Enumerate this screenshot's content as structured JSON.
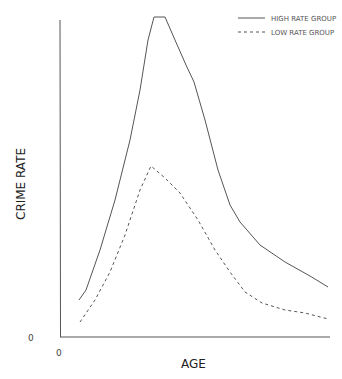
{
  "chart_data": {
    "type": "line",
    "title": "",
    "xlabel": "AGE",
    "ylabel": "CRIME RATE",
    "x_origin_label": "0",
    "y_origin_label": "0",
    "grid": false,
    "legend_position": "top-right",
    "series": [
      {
        "name": "HIGH RATE GROUP",
        "style": "solid",
        "points": [
          [
            79,
            300
          ],
          [
            86,
            290
          ],
          [
            100,
            250
          ],
          [
            115,
            200
          ],
          [
            130,
            140
          ],
          [
            140,
            90
          ],
          [
            148,
            40
          ],
          [
            154,
            17
          ],
          [
            165,
            17
          ],
          [
            175,
            40
          ],
          [
            186,
            65
          ],
          [
            194,
            82
          ],
          [
            205,
            120
          ],
          [
            218,
            170
          ],
          [
            230,
            205
          ],
          [
            240,
            222
          ],
          [
            260,
            245
          ],
          [
            285,
            262
          ],
          [
            310,
            276
          ],
          [
            328,
            287
          ]
        ]
      },
      {
        "name": "LOW RATE GROUP",
        "style": "dashed",
        "points": [
          [
            80,
            322
          ],
          [
            95,
            300
          ],
          [
            110,
            272
          ],
          [
            125,
            235
          ],
          [
            140,
            190
          ],
          [
            151,
            166
          ],
          [
            165,
            178
          ],
          [
            180,
            193
          ],
          [
            198,
            220
          ],
          [
            215,
            250
          ],
          [
            230,
            272
          ],
          [
            245,
            292
          ],
          [
            262,
            303
          ],
          [
            285,
            310
          ],
          [
            305,
            313
          ],
          [
            328,
            319
          ]
        ]
      }
    ],
    "axes": {
      "y_axis": {
        "x": 60,
        "y_top": 20,
        "y_bottom": 337
      },
      "x_axis": {
        "y": 337,
        "x_left": 60,
        "x_right": 330
      }
    }
  },
  "legend": {
    "high": "HIGH RATE GROUP",
    "low": "LOW RATE GROUP"
  },
  "labels": {
    "x_axis": "AGE",
    "y_axis": "CRIME RATE",
    "x_zero": "0",
    "y_zero": "0"
  },
  "colors": {
    "line": "#555555",
    "axis": "#555555"
  }
}
